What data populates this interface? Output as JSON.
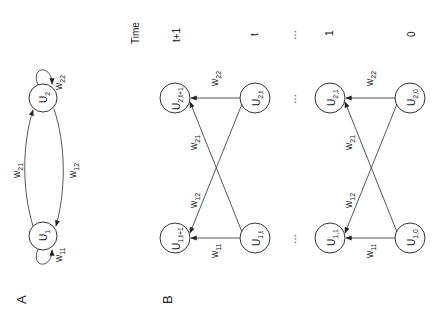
{
  "panel_a": {
    "label": "A",
    "nodes": {
      "u1": "U",
      "u1_sub": "1",
      "u2": "U",
      "u2_sub": "2"
    },
    "weights": {
      "w11": "w",
      "w11_sub": "11",
      "w22": "w",
      "w22_sub": "22",
      "w21": "w",
      "w21_sub": "21",
      "w12": "w",
      "w12_sub": "12"
    }
  },
  "panel_b": {
    "label": "B",
    "time_header": "Time",
    "time_labels": [
      "t+1",
      "t",
      "…",
      "1",
      "0"
    ],
    "nodes": {
      "u2_t1": "U",
      "u2_t1_sub": "2,t+1",
      "u1_t1": "U",
      "u1_t1_sub": "1,t+1",
      "u2_t": "U",
      "u2_t_sub": "2,t",
      "u1_t": "U",
      "u1_t_sub": "1,t",
      "u2_1": "U",
      "u2_1_sub": "2,1",
      "u1_1": "U",
      "u1_1_sub": "1,1",
      "u2_0": "U",
      "u2_0_sub": "2,0",
      "u1_0": "U",
      "u1_0_sub": "1,0"
    },
    "ellipsis": "…",
    "weights_top": {
      "w22": "w",
      "w22_sub": "22",
      "w21": "w",
      "w21_sub": "21",
      "w12": "w",
      "w12_sub": "12",
      "w11": "w",
      "w11_sub": "11"
    },
    "weights_bottom": {
      "w22": "w",
      "w22_sub": "22",
      "w21": "w",
      "w21_sub": "21",
      "w12": "w",
      "w12_sub": "12",
      "w11": "w",
      "w11_sub": "11"
    }
  }
}
